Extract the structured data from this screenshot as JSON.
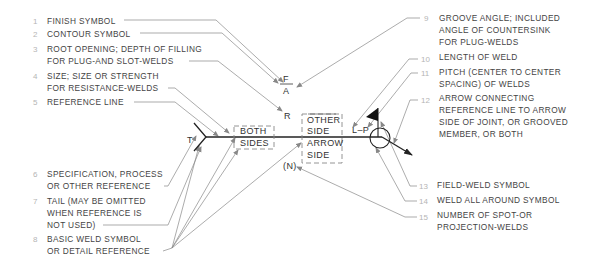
{
  "callouts_left": [
    {
      "num": "1",
      "lines": [
        "FINISH SYMBOL"
      ]
    },
    {
      "num": "2",
      "lines": [
        "CONTOUR SYMBOL"
      ]
    },
    {
      "num": "3",
      "lines": [
        "ROOT OPENING; DEPTH OF FILLING",
        "FOR PLUG-AND SLOT-WELDS"
      ]
    },
    {
      "num": "4",
      "lines": [
        "SIZE; SIZE OR STRENGTH",
        "FOR RESISTANCE-WELDS"
      ]
    },
    {
      "num": "5",
      "lines": [
        "REFERENCE LINE"
      ]
    },
    {
      "num": "6",
      "lines": [
        "SPECIFICATION, PROCESS",
        "OR OTHER REFERENCE"
      ]
    },
    {
      "num": "7",
      "lines": [
        "TAIL (MAY BE OMITTED",
        "WHEN REFERENCE IS",
        "NOT USED)"
      ]
    },
    {
      "num": "8",
      "lines": [
        "BASIC WELD SYMBOL",
        "OR DETAIL REFERENCE"
      ]
    }
  ],
  "callouts_right": [
    {
      "num": "9",
      "lines": [
        "GROOVE ANGLE; INCLUDED",
        "ANGLE OF COUNTERSINK",
        "FOR PLUG-WELDS"
      ]
    },
    {
      "num": "10",
      "lines": [
        "LENGTH OF WELD"
      ]
    },
    {
      "num": "11",
      "lines": [
        "PITCH (CENTER TO CENTER",
        "SPACING) OF WELDS"
      ]
    },
    {
      "num": "12",
      "lines": [
        "ARROW CONNECTING",
        "REFERENCE LINE TO ARROW",
        "SIDE OF JOINT, OR GROOVED",
        "MEMBER, OR BOTH"
      ]
    },
    {
      "num": "13",
      "lines": [
        "FIELD-WELD SYMBOL"
      ]
    },
    {
      "num": "14",
      "lines": [
        "WELD ALL AROUND SYMBOL"
      ]
    },
    {
      "num": "15",
      "lines": [
        "NUMBER OF SPOT-OR",
        "PROJECTION-WELDS"
      ]
    }
  ],
  "symbol": {
    "finish": "F",
    "angle": "A",
    "root": "R",
    "tail": "T",
    "spec": "S",
    "length_pitch": "L–P",
    "number": "(N)",
    "both_sides": [
      "BOTH",
      "SIDES"
    ],
    "other_side": [
      "OTHER",
      "SIDE"
    ],
    "arrow_side": [
      "ARROW",
      "SIDE"
    ]
  }
}
